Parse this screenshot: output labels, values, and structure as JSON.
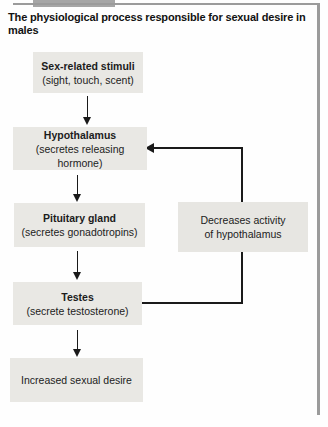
{
  "figure": {
    "title": "The physiological process responsible for sexual desire in males",
    "flow": [
      {
        "heading": "Sex-related stimuli",
        "subtext": "(sight, touch, scent)"
      },
      {
        "heading": "Hypothalamus",
        "subtext": "(secretes releasing hormone)"
      },
      {
        "heading": "Pituitary gland",
        "subtext": "(secretes gonadotropins)"
      },
      {
        "heading": "Testes",
        "subtext": "(secrete testosterone)"
      },
      {
        "text": "Increased sexual desire"
      }
    ],
    "feedback": {
      "label_line1": "Decreases activity",
      "label_line2": "of hypothalamus"
    },
    "colors": {
      "box_fill": "#e9e8e4",
      "line": "#1a1a1a",
      "frame_border": "#9b9b9b",
      "text": "#1c1c1c"
    }
  }
}
